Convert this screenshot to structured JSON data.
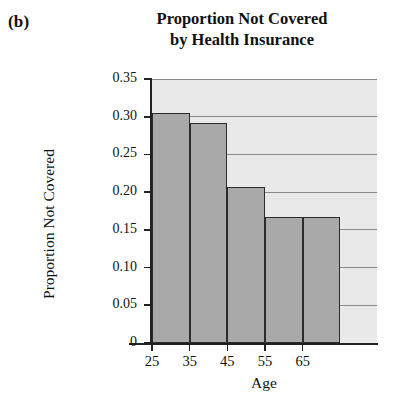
{
  "panel": {
    "label": "(b)"
  },
  "chart_data": {
    "type": "bar",
    "title_line1": "Proportion Not Covered",
    "title_line2": "by Health Insurance",
    "title": "Proportion Not Covered by Health Insurance",
    "xlabel": "Age",
    "ylabel": "Proportion Not Covered",
    "categories": [
      "25",
      "35",
      "45",
      "55",
      "65"
    ],
    "values": [
      0.305,
      0.292,
      0.207,
      0.167,
      0.167
    ],
    "ylim": [
      0,
      0.35
    ],
    "ytick_labels": [
      "0.35",
      "0.30",
      "0.25",
      "0.20",
      "0.15",
      "0.10",
      "0.05",
      "0"
    ],
    "ytick_values": [
      0.35,
      0.3,
      0.25,
      0.2,
      0.15,
      0.1,
      0.05,
      0
    ],
    "grid": true,
    "legend": "none",
    "bar_fill": "#a9a9a9",
    "bar_edge": "#2b2b2b",
    "plot_background": "#e9e9e9",
    "gridline_color": "#8a8a8a"
  }
}
